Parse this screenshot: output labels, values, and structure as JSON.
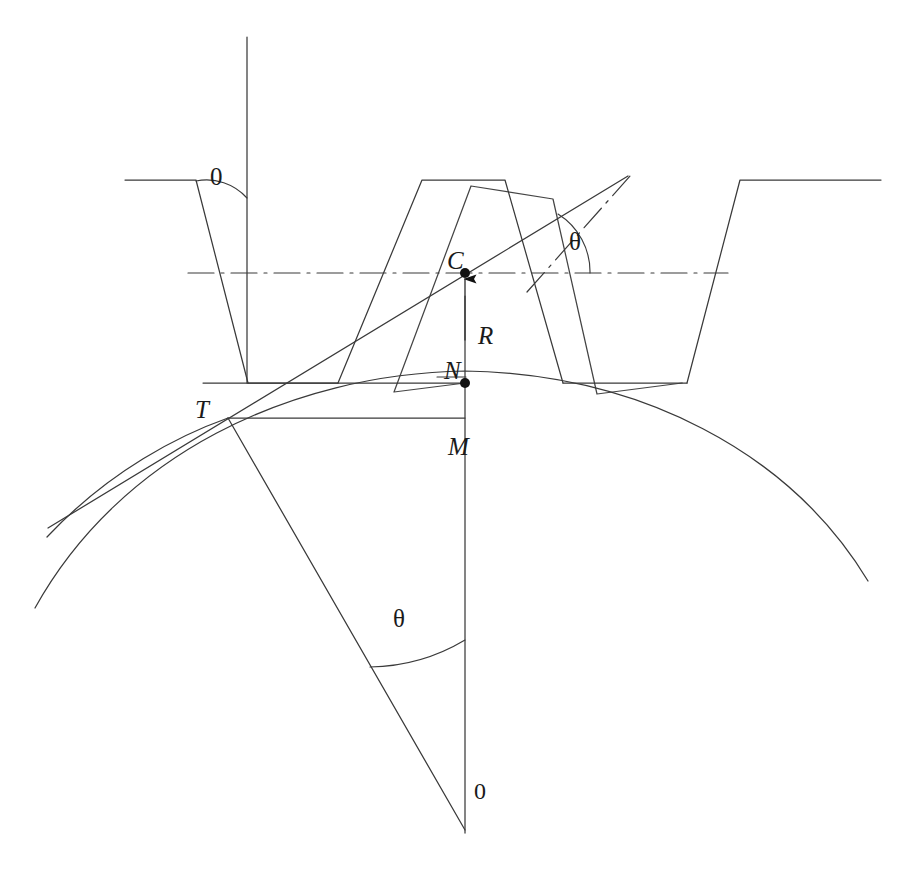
{
  "figure": {
    "type": "engineering-line-diagram",
    "stroke_color": "#333333",
    "background_color": "#ffffff",
    "width": 903,
    "height": 871
  },
  "labels": {
    "angle_top_left": "0",
    "angle_top_right": "θ",
    "point_c": "C",
    "dimension_r": "R",
    "point_n": "N",
    "dimension_m": "M",
    "point_t": "T",
    "angle_bottom": "θ",
    "center_zero": "0"
  },
  "label_positions": {
    "angle_top_left": {
      "x": 210,
      "y": 163
    },
    "angle_top_right": {
      "x": 569,
      "y": 228
    },
    "point_c": {
      "x": 447,
      "y": 247
    },
    "dimension_r": {
      "x": 478,
      "y": 322
    },
    "point_n": {
      "x": 444,
      "y": 360
    },
    "dimension_m": {
      "x": 448,
      "y": 433
    },
    "point_t": {
      "x": 195,
      "y": 397
    },
    "angle_bottom": {
      "x": 393,
      "y": 607
    },
    "center_zero": {
      "x": 474,
      "y": 778
    }
  },
  "geometry": {
    "pitch_line_y": 273,
    "root_line_y": 383,
    "tip_line_y": 180,
    "center_x": 465,
    "pivot": {
      "x": 465,
      "y": 830
    },
    "points": {
      "C": {
        "x": 465,
        "y": 273
      },
      "N": {
        "x": 465,
        "y": 383
      },
      "T": {
        "x": 228,
        "y": 418
      },
      "O": {
        "x": 465,
        "y": 830
      }
    },
    "pressure_angle_deg": 20,
    "theta_deg": 19
  },
  "rack": {
    "teeth": [
      {
        "name": "left-tooth",
        "tip_left": 125,
        "tip_right": 195,
        "root_left": 125,
        "root_right": 248
      },
      {
        "name": "middle-tooth",
        "tip_left": 422,
        "tip_right": 505,
        "root_left": 338,
        "root_right": 563
      },
      {
        "name": "right-tooth",
        "tip_left": 740,
        "tip_right": 880,
        "root_left": 687,
        "root_right": 880
      }
    ]
  },
  "lines": {
    "vertical_top_axis": {
      "x": 247,
      "y1": 37,
      "y2": 383
    },
    "centerline_x1": 188,
    "centerline_x2": 728,
    "tangent_line": {
      "x1": 48,
      "y1": 528,
      "x2": 628,
      "y2": 176
    },
    "pitch_curve_left": 35,
    "pitch_curve_right": 868
  }
}
